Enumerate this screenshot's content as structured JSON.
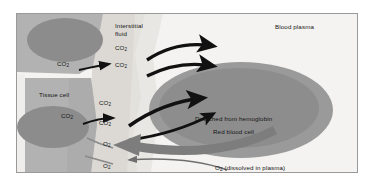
{
  "diagram": {
    "regions": {
      "tissue_cell": {
        "label": "Tissue cell",
        "color": "#9e9e9e"
      },
      "interstitial_fluid": {
        "label": "Interstitial\nfluid",
        "line1": "Interstitial",
        "line2": "fluid",
        "color": "#dedbd6"
      },
      "blood_plasma": {
        "label": "Blood plasma",
        "color": "#f4f3f1"
      },
      "red_blood_cell": {
        "label": "Red blood cell",
        "color": "#8d8d8d"
      }
    },
    "annotations": {
      "detached": "Detached from hemoglobin",
      "o2_dissolved_prefix": "O",
      "o2_dissolved_sub": "2",
      "o2_dissolved_rest": " (dissolved in plasma)"
    },
    "molecules": {
      "co2": "CO",
      "co2_sub": "2",
      "o2": "O",
      "o2_sub": "2"
    },
    "co2_labels": [
      {
        "id": "co2-tissue-out",
        "x": 72,
        "y": 65
      },
      {
        "id": "co2-interstitial-upper",
        "x": 116,
        "y": 46
      },
      {
        "id": "co2-interstitial-lower",
        "x": 116,
        "y": 62
      },
      {
        "id": "co2-cell-edge",
        "x": 74,
        "y": 119
      },
      {
        "id": "co2-fluid-upper",
        "x": 100,
        "y": 108
      },
      {
        "id": "co2-fluid-lower",
        "x": 100,
        "y": 128
      }
    ],
    "o2_labels": [
      {
        "id": "o2-upper",
        "x": 104,
        "y": 141
      },
      {
        "id": "o2-lower",
        "x": 104,
        "y": 163
      }
    ],
    "colors": {
      "frame_border": "#9a9a9a",
      "plasma_bg": "#f4f3f1",
      "tissue_body": "#b2b2b2",
      "tissue_nucleus": "#8c8c8c",
      "interstitial": "#dcd9d4",
      "rbc_outer": "#9a9a9a",
      "rbc_inner": "#8a8a8a",
      "arrow_black": "#111111",
      "arrow_gray": "#7d7d7d",
      "text": "#141414"
    }
  }
}
